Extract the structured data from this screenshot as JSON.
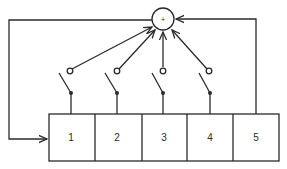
{
  "diagram": {
    "summing_junction": {
      "symbol": "+",
      "icon": "summing-junction-icon"
    },
    "blocks": [
      {
        "label": "1"
      },
      {
        "label": "2"
      },
      {
        "label": "3"
      },
      {
        "label": "4"
      },
      {
        "label": "5"
      }
    ],
    "switches": [
      {
        "name": "switch-1",
        "state": "open"
      },
      {
        "name": "switch-2",
        "state": "open"
      },
      {
        "name": "switch-3",
        "state": "open"
      },
      {
        "name": "switch-4",
        "state": "open"
      }
    ],
    "colors": {
      "line": "#2a2a2a",
      "background": "#ffffff"
    }
  }
}
